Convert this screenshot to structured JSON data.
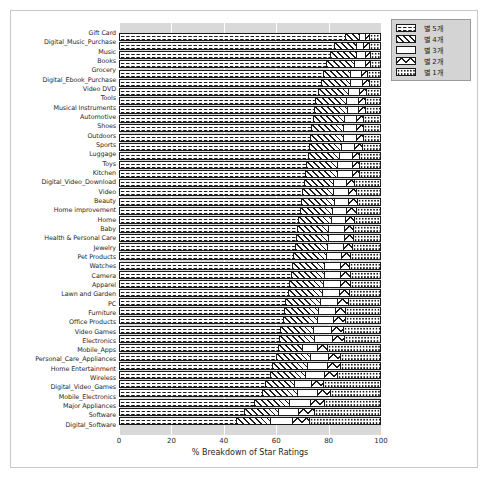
{
  "chart_data": {
    "type": "bar",
    "subtype": "horizontal-stacked-percent",
    "title": "",
    "xlabel": "% Breakdown of Star Ratings",
    "ylabel": "",
    "xlim": [
      0,
      100
    ],
    "xticks": [
      0,
      20,
      40,
      60,
      80,
      100
    ],
    "grid": true,
    "legend_position": "upper right",
    "categories": [
      "Gift Card",
      "Digital_Music_Purchase",
      "Music",
      "Books",
      "Grocery",
      "Digital_Ebook_Purchase",
      "Video DVD",
      "Tools",
      "Musical Instruments",
      "Automotive",
      "Shoes",
      "Outdoors",
      "Sports",
      "Luggage",
      "Toys",
      "Kitchen",
      "Digital_Video_Download",
      "Video",
      "Beauty",
      "Home improvement",
      "Home",
      "Baby",
      "Health & Personal Care",
      "Jewelry",
      "Pet Products",
      "Watches",
      "Camera",
      "Apparel",
      "Lawn and Garden",
      "PC",
      "Furniture",
      "Office Products",
      "Video Games",
      "Electronics",
      "Mobile_Apps",
      "Personal_Care_Appliances",
      "Home Entertainment",
      "Wireless",
      "Digital_Video_Games",
      "Mobile_Electronics",
      "Major Appliances",
      "Software",
      "Digital_Software"
    ],
    "series": [
      {
        "name": "별 5개",
        "pattern": "circles",
        "values": [
          87.0,
          82.5,
          81.0,
          79.5,
          78.5,
          77.5,
          76.5,
          75.5,
          75.0,
          74.5,
          74.0,
          73.5,
          73.0,
          72.5,
          72.0,
          71.5,
          71.0,
          70.5,
          70.0,
          69.5,
          69.0,
          68.5,
          68.0,
          67.5,
          67.0,
          66.5,
          66.0,
          65.5,
          65.0,
          64.0,
          63.5,
          63.0,
          62.0,
          61.5,
          61.0,
          60.5,
          59.0,
          58.0,
          56.0,
          55.0,
          52.0,
          48.0,
          45.0
        ]
      },
      {
        "name": "별 4개",
        "pattern": "diagonal",
        "values": [
          5.5,
          8.5,
          10.0,
          11.0,
          10.5,
          11.5,
          11.5,
          12.0,
          12.5,
          12.0,
          12.0,
          12.5,
          12.5,
          12.0,
          12.0,
          12.5,
          11.5,
          12.0,
          12.5,
          12.5,
          12.5,
          12.0,
          12.5,
          12.5,
          12.5,
          12.5,
          13.0,
          13.0,
          13.0,
          13.5,
          13.0,
          13.0,
          12.5,
          13.5,
          9.5,
          13.0,
          13.5,
          13.5,
          11.5,
          13.5,
          13.5,
          13.0,
          13.0
        ]
      },
      {
        "name": "별 3개",
        "pattern": "blank",
        "values": [
          2.0,
          3.0,
          3.5,
          4.0,
          4.0,
          4.5,
          4.5,
          4.5,
          4.5,
          4.5,
          5.0,
          5.0,
          5.0,
          5.0,
          5.5,
          5.5,
          5.0,
          5.5,
          5.5,
          5.5,
          5.5,
          6.0,
          6.0,
          6.0,
          6.0,
          6.0,
          6.0,
          6.5,
          6.5,
          6.5,
          6.5,
          6.5,
          7.0,
          7.0,
          5.5,
          7.0,
          7.5,
          7.5,
          6.5,
          7.5,
          8.0,
          8.0,
          8.5
        ]
      },
      {
        "name": "별 2개",
        "pattern": "cross",
        "values": [
          1.5,
          2.0,
          2.0,
          2.0,
          2.5,
          2.5,
          2.5,
          2.5,
          2.5,
          3.0,
          3.0,
          3.0,
          3.0,
          3.0,
          3.0,
          3.0,
          3.0,
          3.0,
          3.5,
          3.5,
          3.5,
          3.5,
          3.5,
          3.5,
          3.5,
          3.5,
          4.0,
          4.0,
          4.0,
          4.0,
          4.0,
          4.5,
          4.5,
          4.5,
          4.0,
          4.5,
          5.0,
          5.0,
          4.5,
          5.0,
          5.5,
          6.0,
          6.5
        ]
      },
      {
        "name": "별 1개",
        "pattern": "dots",
        "values": [
          4.0,
          4.0,
          3.5,
          3.5,
          4.5,
          4.0,
          5.0,
          5.5,
          5.5,
          6.0,
          6.0,
          6.0,
          6.5,
          7.5,
          7.5,
          7.5,
          9.5,
          9.0,
          8.5,
          9.0,
          9.5,
          10.0,
          10.0,
          10.5,
          11.0,
          11.5,
          11.0,
          11.0,
          11.5,
          12.0,
          13.0,
          13.0,
          14.0,
          13.5,
          20.0,
          15.0,
          15.0,
          16.0,
          21.5,
          19.0,
          21.0,
          25.0,
          27.0
        ]
      }
    ]
  },
  "legend": {
    "entries": [
      {
        "label": "별 5개",
        "pattern": "circles"
      },
      {
        "label": "별 4개",
        "pattern": "diagonal"
      },
      {
        "label": "별 3개",
        "pattern": "blank"
      },
      {
        "label": "별 2개",
        "pattern": "cross"
      },
      {
        "label": "별 1개",
        "pattern": "dots"
      }
    ]
  },
  "colors": {
    "plot_background": "#d9d9d9",
    "figure_background": "#ffffff",
    "gridline": "#ffffff",
    "ink": "#1c1c1c",
    "legend_background": "#d4d4d4"
  }
}
